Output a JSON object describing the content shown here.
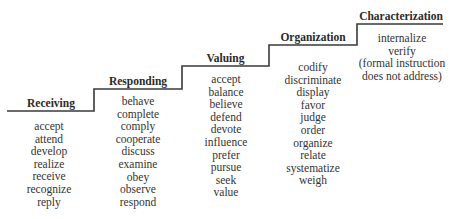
{
  "diagram": {
    "type": "staircase",
    "line_color": "#3a3a3a",
    "levels": [
      {
        "title": "Receiving",
        "verbs": [
          "accept",
          "attend",
          "develop",
          "realize",
          "receive",
          "recognize",
          "reply"
        ]
      },
      {
        "title": "Responding",
        "verbs": [
          "behave",
          "complete",
          "comply",
          "cooperate",
          "discuss",
          "examine",
          "obey",
          "observe",
          "respond"
        ]
      },
      {
        "title": "Valuing",
        "verbs": [
          "accept",
          "balance",
          "believe",
          "defend",
          "devote",
          "influence",
          "prefer",
          "pursue",
          "seek",
          "value"
        ]
      },
      {
        "title": "Organization",
        "verbs": [
          "codify",
          "discriminate",
          "display",
          "favor",
          "judge",
          "order",
          "organize",
          "relate",
          "systematize",
          "weigh"
        ]
      },
      {
        "title": "Characterization",
        "verbs": [
          "internalize",
          "verify",
          "(formal instruction",
          "does not address)"
        ]
      }
    ]
  }
}
